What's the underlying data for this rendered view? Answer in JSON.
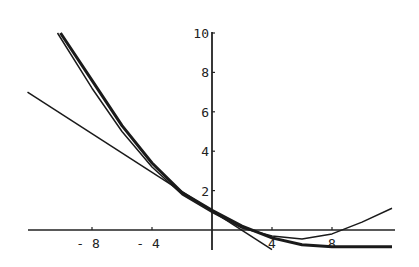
{
  "chart_data": {
    "type": "line",
    "title": "",
    "xlabel": "",
    "ylabel": "",
    "xlim": [
      -14,
      12.2
    ],
    "ylim": [
      -1.2,
      10
    ],
    "grid": false,
    "legend": null,
    "x_ticks": [
      "-8",
      "-4",
      "4",
      "8"
    ],
    "y_ticks": [
      "2",
      "4",
      "6",
      "8",
      "10"
    ],
    "series": [
      {
        "name": "curve-thick",
        "stroke_width": 3,
        "points": [
          [
            -10.1,
            10
          ],
          [
            -8,
            7.6
          ],
          [
            -6,
            5.3
          ],
          [
            -4,
            3.4
          ],
          [
            -2,
            1.9
          ],
          [
            0,
            1.0
          ],
          [
            2,
            0.2
          ],
          [
            4,
            -0.4
          ],
          [
            6,
            -0.75
          ],
          [
            8,
            -0.85
          ],
          [
            10,
            -0.85
          ],
          [
            12,
            -0.85
          ]
        ]
      },
      {
        "name": "curve-parabola",
        "stroke_width": 1.5,
        "points": [
          [
            -10.3,
            10
          ],
          [
            -8,
            7.2
          ],
          [
            -6,
            5.0
          ],
          [
            -4,
            3.2
          ],
          [
            -2,
            1.8
          ],
          [
            0,
            0.9
          ],
          [
            2,
            0.1
          ],
          [
            4,
            -0.3
          ],
          [
            6,
            -0.45
          ],
          [
            8,
            -0.2
          ],
          [
            10,
            0.4
          ],
          [
            12,
            1.1
          ]
        ]
      },
      {
        "name": "tangent-line",
        "stroke_width": 1.5,
        "points": [
          [
            -12.3,
            7.0
          ],
          [
            4.0,
            -1.0
          ]
        ]
      }
    ]
  }
}
